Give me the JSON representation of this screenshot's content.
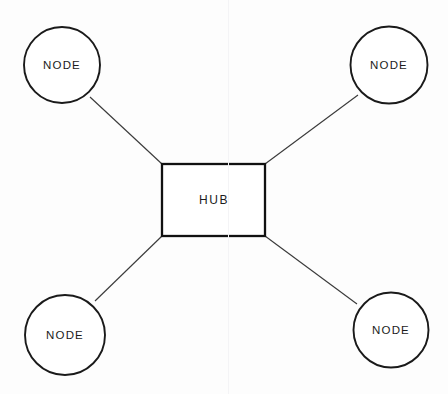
{
  "diagram": {
    "background_color": "#fdfdfd",
    "stroke_color": "#1a1a1a",
    "edge_color": "#3b3b3b",
    "hub": {
      "label": "HUB",
      "shape": "rectangle",
      "x": 162,
      "y": 164,
      "width": 103,
      "height": 72,
      "center_x": 213.5,
      "center_y": 200
    },
    "nodes": [
      {
        "id": "node-top-left",
        "label": "NODE",
        "shape": "circle",
        "center_x": 62,
        "center_y": 65,
        "radius": 38
      },
      {
        "id": "node-top-right",
        "label": "NODE",
        "shape": "circle",
        "center_x": 389,
        "center_y": 65,
        "radius": 38.5
      },
      {
        "id": "node-bottom-left",
        "label": "NODE",
        "shape": "circle",
        "center_x": 65,
        "center_y": 335,
        "radius": 40
      },
      {
        "id": "node-bottom-right",
        "label": "NODE",
        "shape": "circle",
        "center_x": 391,
        "center_y": 330,
        "radius": 37.5
      }
    ],
    "edges": [
      {
        "id": "edge-hub-top-left",
        "from": "hub",
        "to": "node-top-left",
        "x1": 162,
        "y1": 164,
        "x2": 90,
        "y2": 97
      },
      {
        "id": "edge-hub-top-right",
        "from": "hub",
        "to": "node-top-right",
        "x1": 265,
        "y1": 164,
        "x2": 358,
        "y2": 95
      },
      {
        "id": "edge-hub-bottom-left",
        "from": "hub",
        "to": "node-bottom-left",
        "x1": 162,
        "y1": 236,
        "x2": 95,
        "y2": 301
      },
      {
        "id": "edge-hub-bottom-right",
        "from": "hub",
        "to": "node-bottom-right",
        "x1": 265,
        "y1": 236,
        "x2": 357,
        "y2": 304
      }
    ]
  }
}
